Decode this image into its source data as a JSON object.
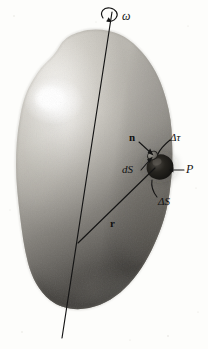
{
  "figure": {
    "background_color": "#fdfdfb",
    "ink_color": "#141414"
  },
  "labels": {
    "omega": "ω",
    "normal_vector": "n",
    "delta_tau": "Δτ",
    "surface_element": "dS",
    "point_p": "P",
    "delta_s": "ΔS",
    "position_vector": "r"
  },
  "elements": {
    "rotation_axis": "rotation-axis-line",
    "rotation_arrow": "angular-velocity-curl-arrow",
    "body_outline": "rigid-body-silhouette",
    "highlight": "specular-highlight",
    "volume_element_blob": "delta-tau-volume-element",
    "surface_patch": "dS-surface-patch-ellipse",
    "position_vector_line": "r-vector-line"
  },
  "colors": {
    "body_light": "#e8e6e1",
    "body_mid": "#b8b5ae",
    "body_dark": "#6b6862",
    "body_darkest": "#2e2c29",
    "highlight": "#ffffff",
    "blob_dark": "#1b1a18",
    "line": "#141414"
  },
  "geometry": {
    "axis_top": [
      112,
      12
    ],
    "axis_bottom": [
      62,
      338
    ],
    "r_origin": [
      78,
      243
    ],
    "r_tip": [
      150,
      170
    ],
    "blob_center": [
      160,
      166
    ],
    "highlight_center": [
      52,
      100
    ]
  }
}
